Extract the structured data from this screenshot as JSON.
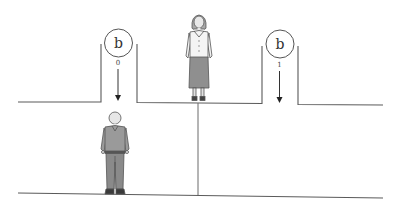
{
  "diagram": {
    "particles": [
      {
        "symbol": "b",
        "index_label": "0"
      },
      {
        "symbol": "b",
        "index_label": "1"
      }
    ],
    "figures": [
      {
        "name": "woman",
        "position": "upper-middle"
      },
      {
        "name": "man",
        "position": "lower-left"
      }
    ],
    "colors": {
      "line": "#555555",
      "background": "#ffffff",
      "shirt_man": "#9a9a9a",
      "pants_man": "#8a8a8a",
      "skirt_woman": "#8f8f8f",
      "blouse_woman": "#f4f4f4",
      "skin": "#e6e6e6"
    }
  }
}
